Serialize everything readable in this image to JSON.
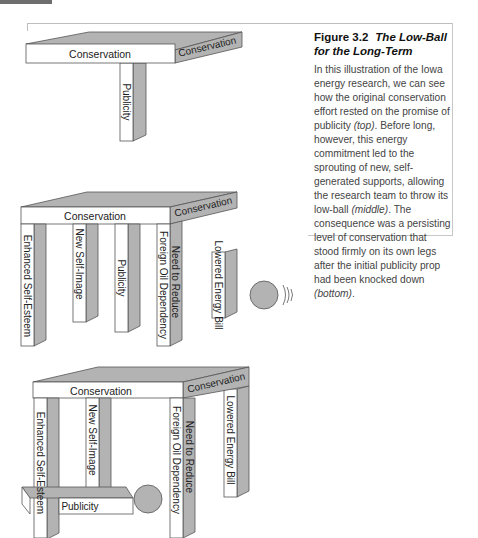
{
  "figure": {
    "number": "Figure 3.2",
    "title": "The Low-Ball for the Long-Term",
    "caption_parts": [
      {
        "text": "In this illustration of the Iowa energy research, we can see how the original conservation effort rested on the promise of publicity ",
        "italic": false
      },
      {
        "text": "(top)",
        "italic": true
      },
      {
        "text": ". Before long, however, this energy commitment led to the sprouting of new, self-generated supports, allowing the research team to throw its low-ball ",
        "italic": false
      },
      {
        "text": "(middle)",
        "italic": true
      },
      {
        "text": ". The consequence was a persisting level of conservation that stood firmly on its own legs after the initial publicity prop had been knocked down ",
        "italic": false
      },
      {
        "text": "(bottom)",
        "italic": true
      },
      {
        "text": ".",
        "italic": false
      }
    ]
  },
  "colors": {
    "shade": "#b3b3b3",
    "outline": "#555555",
    "face": "#ffffff",
    "text": "#222222"
  },
  "panels": {
    "top": {
      "tabletop_front": "Conservation",
      "tabletop_side": "Conservation",
      "legs": [
        "Publicity"
      ]
    },
    "middle": {
      "tabletop_front": "Conservation",
      "tabletop_side": "Conservation",
      "legs": [
        "Enhanced Self-Esteem",
        "New Self-Image",
        "Publicity",
        "Foreign Oil Dependency",
        "Need to Reduce",
        "Lowered Energy Bill"
      ],
      "ball": "wrecking-ball"
    },
    "bottom": {
      "tabletop_front": "Conservation",
      "tabletop_side": "Conservation",
      "legs": [
        "Enhanced Self-Esteem",
        "New Self-Image",
        "Foreign Oil Dependency",
        "Need to Reduce",
        "Lowered Energy Bill"
      ],
      "fallen_leg": "Publicity",
      "ball": "wrecking-ball"
    }
  }
}
